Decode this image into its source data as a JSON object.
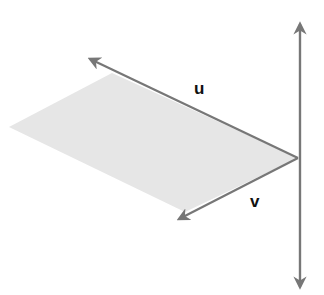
{
  "diagram": {
    "labels": {
      "u": "u",
      "v": "v"
    },
    "colors": {
      "arrow": "#777777",
      "plane_fill": "#e6e6e6",
      "label": "#111111"
    },
    "elements": [
      "vertical axis (normal line)",
      "vector u",
      "vector v",
      "shaded parallelogram spanned by u and v"
    ]
  }
}
